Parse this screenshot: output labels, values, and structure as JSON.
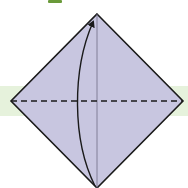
{
  "diagram": {
    "type": "origami-fold-step",
    "description": "Square paper rotated as a diamond; fold bottom corner up to top along the horizontal dashed valley line",
    "colors": {
      "background": "#ffffff",
      "band": "#e6f2dc",
      "paper_fill": "#c8c6e0",
      "outline": "#1a1a1a",
      "center_line": "#6e6c86",
      "fold_line": "#1a1a1a",
      "arrow": "#1a1a1a",
      "top_fragment": "#6a9a3a"
    },
    "shape": {
      "top": [
        97,
        14
      ],
      "right": [
        183,
        101
      ],
      "bottom": [
        97,
        188
      ],
      "left": [
        11,
        101
      ]
    },
    "center_line": {
      "x": 97,
      "y1": 14,
      "y2": 188
    },
    "fold_line": {
      "style": "dashed",
      "y": 101,
      "x1": 11,
      "x2": 183,
      "label": "valley-fold"
    },
    "arrow": {
      "from": "bottom-corner",
      "to": "top-corner",
      "direction": "up",
      "curve": "left"
    }
  }
}
